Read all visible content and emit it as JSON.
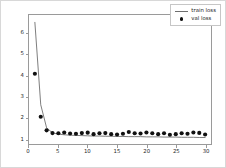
{
  "chart_data": {
    "type": "line",
    "title": "",
    "xlabel": "",
    "ylabel": "",
    "xlim": [
      0,
      31
    ],
    "ylim": [
      0.75,
      6.9
    ],
    "grid": false,
    "legend_position": "upper right",
    "xticks": [
      0,
      5,
      10,
      15,
      20,
      25,
      30
    ],
    "yticks": [
      1,
      2,
      3,
      4,
      5,
      6
    ],
    "xtick_labels": [
      "0",
      "5",
      "10",
      "15",
      "20",
      "25",
      "30"
    ],
    "ytick_labels": [
      "1",
      "2",
      "3",
      "4",
      "5",
      "6"
    ],
    "x": [
      1,
      2,
      3,
      4,
      5,
      6,
      7,
      8,
      9,
      10,
      11,
      12,
      13,
      14,
      15,
      16,
      17,
      18,
      19,
      20,
      21,
      22,
      23,
      24,
      25,
      26,
      27,
      28,
      29,
      30
    ],
    "series": [
      {
        "name": "train loss",
        "style": "line",
        "color": "#6e6e6e",
        "values": [
          6.55,
          2.62,
          1.52,
          1.28,
          1.22,
          1.19,
          1.17,
          1.16,
          1.15,
          1.14,
          1.13,
          1.13,
          1.12,
          1.12,
          1.11,
          1.11,
          1.1,
          1.1,
          1.1,
          1.09,
          1.09,
          1.09,
          1.08,
          1.08,
          1.08,
          1.07,
          1.07,
          1.07,
          1.06,
          1.06
        ]
      },
      {
        "name": "val loss",
        "style": "markers",
        "color": "#111111",
        "values": [
          4.1,
          2.05,
          1.4,
          1.27,
          1.26,
          1.3,
          1.25,
          1.24,
          1.27,
          1.29,
          1.22,
          1.26,
          1.27,
          1.22,
          1.2,
          1.24,
          1.32,
          1.26,
          1.25,
          1.3,
          1.26,
          1.22,
          1.26,
          1.19,
          1.22,
          1.26,
          1.24,
          1.3,
          1.28,
          1.2
        ]
      }
    ]
  },
  "legend": {
    "items": [
      {
        "label": "train loss",
        "key": "line-key"
      },
      {
        "label": "val loss",
        "key": "dot-key"
      }
    ]
  }
}
